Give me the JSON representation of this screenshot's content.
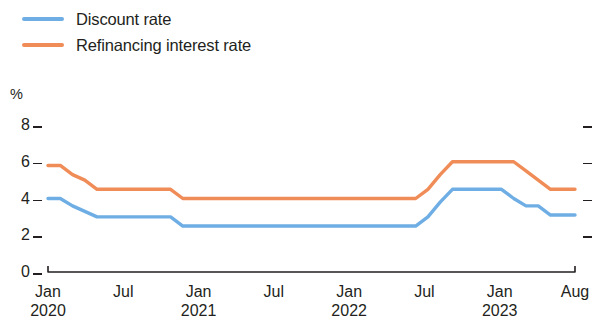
{
  "legend": {
    "position": "top-left",
    "items": [
      {
        "label": "Discount rate",
        "color": "#6faee4",
        "key": "discount"
      },
      {
        "label": "Refinancing interest rate",
        "color": "#f08c57",
        "key": "refinancing"
      }
    ]
  },
  "axes": {
    "y_unit": "%",
    "y_ticks": [
      "8",
      "6",
      "4",
      "2",
      "0"
    ],
    "x_ticks": [
      {
        "month": "Jan",
        "year": "2020"
      },
      {
        "month": "Jul",
        "year": ""
      },
      {
        "month": "Jan",
        "year": "2021"
      },
      {
        "month": "Jul",
        "year": ""
      },
      {
        "month": "Jan",
        "year": "2022"
      },
      {
        "month": "Jul",
        "year": ""
      },
      {
        "month": "Jan",
        "year": "2023"
      },
      {
        "month": "Aug",
        "year": ""
      }
    ]
  },
  "chart_data": {
    "type": "line",
    "title": "",
    "subtitle": "",
    "xlabel": "",
    "ylabel": "%",
    "ylim": [
      0,
      8
    ],
    "yticks": [
      0,
      2,
      4,
      6,
      8
    ],
    "grid": false,
    "legend_position": "top-left",
    "x_unit": "month",
    "x_start": "2020-01",
    "x_end": "2023-08",
    "x_tick_labels": [
      "Jan 2020",
      "Jul",
      "Jan 2021",
      "Jul",
      "Jan 2022",
      "Jul",
      "Jan 2023",
      "Aug"
    ],
    "x": [
      "2020-01",
      "2020-02",
      "2020-03",
      "2020-04",
      "2020-05",
      "2020-06",
      "2020-07",
      "2020-08",
      "2020-09",
      "2020-10",
      "2020-11",
      "2020-12",
      "2021-01",
      "2021-02",
      "2021-03",
      "2021-04",
      "2021-05",
      "2021-06",
      "2021-07",
      "2021-08",
      "2021-09",
      "2021-10",
      "2021-11",
      "2021-12",
      "2022-01",
      "2022-02",
      "2022-03",
      "2022-04",
      "2022-05",
      "2022-06",
      "2022-07",
      "2022-08",
      "2022-09",
      "2022-10",
      "2022-11",
      "2022-12",
      "2023-01",
      "2023-02",
      "2023-03",
      "2023-04",
      "2023-05",
      "2023-06",
      "2023-07",
      "2023-08"
    ],
    "series": [
      {
        "name": "Refinancing interest rate",
        "color": "#f08c57",
        "values": [
          5.8,
          5.8,
          5.3,
          5.0,
          4.5,
          4.5,
          4.5,
          4.5,
          4.5,
          4.5,
          4.5,
          4.0,
          4.0,
          4.0,
          4.0,
          4.0,
          4.0,
          4.0,
          4.0,
          4.0,
          4.0,
          4.0,
          4.0,
          4.0,
          4.0,
          4.0,
          4.0,
          4.0,
          4.0,
          4.0,
          4.0,
          4.5,
          5.3,
          6.0,
          6.0,
          6.0,
          6.0,
          6.0,
          6.0,
          5.5,
          5.0,
          4.5,
          4.5,
          4.5
        ]
      },
      {
        "name": "Discount rate",
        "color": "#6faee4",
        "values": [
          4.0,
          4.0,
          3.6,
          3.3,
          3.0,
          3.0,
          3.0,
          3.0,
          3.0,
          3.0,
          3.0,
          2.5,
          2.5,
          2.5,
          2.5,
          2.5,
          2.5,
          2.5,
          2.5,
          2.5,
          2.5,
          2.5,
          2.5,
          2.5,
          2.5,
          2.5,
          2.5,
          2.5,
          2.5,
          2.5,
          2.5,
          3.0,
          3.8,
          4.5,
          4.5,
          4.5,
          4.5,
          4.5,
          4.0,
          3.6,
          3.6,
          3.1,
          3.1,
          3.1
        ]
      }
    ]
  },
  "plot_geometry": {
    "x_left": 48,
    "x_right": 575,
    "y_zero": 272,
    "y_top": 125,
    "y_max_value": 8
  }
}
